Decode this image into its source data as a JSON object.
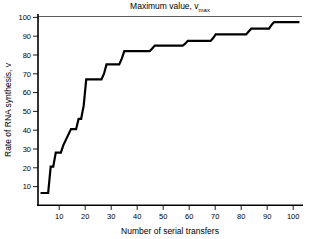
{
  "chart_data": {
    "type": "line",
    "title": "Maximum value, v",
    "title_subscript": "max",
    "xlabel": "Number of serial transfers",
    "ylabel": "Rate of RNA synthesis, v",
    "xlim": [
      0,
      104
    ],
    "ylim": [
      0,
      103
    ],
    "xticks": [
      10,
      20,
      30,
      40,
      50,
      60,
      70,
      80,
      90,
      100
    ],
    "xtick_labels": [
      "10",
      "20",
      "30",
      "40",
      "50",
      "60",
      "70",
      "80",
      "90",
      "100"
    ],
    "yticks": [
      10,
      20,
      30,
      40,
      50,
      60,
      70,
      80,
      90,
      100
    ],
    "ytick_labels": [
      "10",
      "20",
      "30",
      "40",
      "50",
      "60",
      "70",
      "80",
      "90",
      "100"
    ],
    "grid": false,
    "legend": "none",
    "line_color": "#000000",
    "reference_lines": [
      {
        "name": "vmax",
        "y": 100,
        "label": "Maximum value, v max",
        "color": "#4a4a4a"
      }
    ],
    "step_style": "post",
    "x": [
      1,
      4,
      5,
      6,
      7,
      9,
      10,
      13,
      15,
      16,
      17,
      18,
      19,
      25,
      26,
      27,
      32,
      33,
      34,
      44,
      45,
      46,
      57,
      58,
      59,
      68,
      69,
      70,
      82,
      83,
      84,
      91,
      92,
      93,
      103
    ],
    "values": [
      6.5,
      6.5,
      20.5,
      20.5,
      28,
      28,
      32,
      40.5,
      40.5,
      46,
      46,
      53,
      67,
      67,
      70,
      75,
      75,
      78,
      82,
      82,
      83.5,
      85,
      85,
      86,
      87.5,
      87.5,
      89,
      91,
      91,
      92.5,
      94,
      94,
      96,
      97.5,
      97.5
    ]
  },
  "axes": {
    "y_axis_name": "y-axis",
    "x_axis_name": "x-axis"
  }
}
